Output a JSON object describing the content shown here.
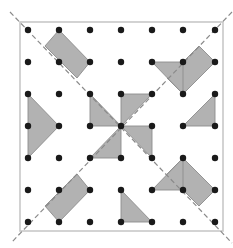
{
  "figure": {
    "width": 233,
    "height": 248,
    "frame": {
      "x": 20,
      "y": 22,
      "w": 203,
      "h": 209
    },
    "colors": {
      "background": "#ffffff",
      "frame": "#c8c8c8",
      "shape_fill": "#b2b2b2",
      "shape_stroke": "#8c8c8c",
      "dot": "#1a1a1a",
      "diagonal": "#8a8a8a"
    },
    "grid": {
      "cols_x": [
        28,
        59,
        90,
        121,
        152,
        183,
        215
      ],
      "rows_y": [
        30,
        62,
        94,
        126,
        158,
        190,
        222
      ],
      "dot_radius": 3.2
    },
    "diagonals": [
      {
        "name": "diagonal-top-left-to-bottom-right",
        "x1": 10,
        "y1": 12,
        "x2": 232,
        "y2": 243
      },
      {
        "name": "diagonal-top-right-to-bottom-left",
        "x1": 232,
        "y1": 12,
        "x2": 11,
        "y2": 243
      }
    ],
    "shapes": [
      {
        "name": "top-left-rectangle",
        "points": [
          [
            59,
            30
          ],
          [
            90,
            62
          ],
          [
            77,
            78
          ],
          [
            45,
            46
          ]
        ]
      },
      {
        "name": "left-triangle",
        "points": [
          [
            28,
            94
          ],
          [
            59,
            126
          ],
          [
            28,
            158
          ]
        ]
      },
      {
        "name": "top-right-rectangle",
        "points": [
          [
            199,
            46
          ],
          [
            215,
            62
          ],
          [
            183,
            94
          ],
          [
            167,
            78
          ]
        ]
      },
      {
        "name": "top-right-triangle",
        "points": [
          [
            152,
            62
          ],
          [
            183,
            62
          ],
          [
            183,
            94
          ]
        ]
      },
      {
        "name": "right-triangle",
        "points": [
          [
            215,
            94
          ],
          [
            215,
            126
          ],
          [
            183,
            126
          ]
        ]
      },
      {
        "name": "pinwheel-blade-top-left",
        "points": [
          [
            90,
            94
          ],
          [
            90,
            126
          ],
          [
            121,
            126
          ]
        ]
      },
      {
        "name": "pinwheel-blade-top-right",
        "points": [
          [
            121,
            94
          ],
          [
            152,
            94
          ],
          [
            121,
            126
          ]
        ]
      },
      {
        "name": "pinwheel-blade-bottom-right",
        "points": [
          [
            121,
            126
          ],
          [
            152,
            126
          ],
          [
            152,
            158
          ]
        ]
      },
      {
        "name": "pinwheel-blade-bottom-left",
        "points": [
          [
            121,
            126
          ],
          [
            121,
            158
          ],
          [
            90,
            158
          ]
        ]
      },
      {
        "name": "bottom-left-rectangle",
        "points": [
          [
            77,
            174
          ],
          [
            90,
            190
          ],
          [
            59,
            222
          ],
          [
            45,
            206
          ]
        ]
      },
      {
        "name": "bottom-triangle",
        "points": [
          [
            121,
            190
          ],
          [
            121,
            222
          ],
          [
            152,
            222
          ]
        ]
      },
      {
        "name": "bottom-right-rectangle",
        "points": [
          [
            183,
            158
          ],
          [
            215,
            190
          ],
          [
            199,
            206
          ],
          [
            167,
            174
          ]
        ]
      },
      {
        "name": "bottom-right-triangle",
        "points": [
          [
            152,
            190
          ],
          [
            183,
            158
          ],
          [
            183,
            190
          ]
        ]
      }
    ]
  }
}
